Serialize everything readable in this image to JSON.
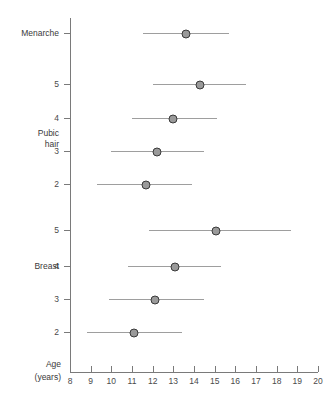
{
  "chart_data": {
    "type": "scatter",
    "title": "",
    "subtitle": "",
    "xlabel": "Age (years)",
    "ylabel": "",
    "xlim": [
      8,
      20
    ],
    "ylim": [
      0,
      10
    ],
    "grid": false,
    "legend": null,
    "orientation": "horizontal",
    "x_ticks": [
      8,
      9,
      10,
      11,
      12,
      13,
      14,
      15,
      16,
      17,
      18,
      19,
      20
    ],
    "x_tick_labels": [
      "8",
      "9",
      "10",
      "11",
      "12",
      "13",
      "14",
      "15",
      "16",
      "17",
      "18",
      "19",
      "20"
    ],
    "groups": [
      {
        "name": "Menarche",
        "label_lines": [
          "Menarche"
        ],
        "stages": [
          {
            "stage": "",
            "median": 13.6,
            "low": 11.55,
            "high": 15.7
          }
        ]
      },
      {
        "name": "Pubic hair",
        "label_lines": [
          "Pubic",
          "hair"
        ],
        "stages": [
          {
            "stage": "5",
            "median": 14.3,
            "low": 12.0,
            "high": 16.5
          },
          {
            "stage": "4",
            "median": 13.0,
            "low": 11.0,
            "high": 15.1
          },
          {
            "stage": "3",
            "median": 12.2,
            "low": 10.0,
            "high": 14.5
          },
          {
            "stage": "2",
            "median": 11.7,
            "low": 9.3,
            "high": 13.9
          }
        ]
      },
      {
        "name": "Breast",
        "label_lines": [
          "Breast"
        ],
        "stages": [
          {
            "stage": "5",
            "median": 15.05,
            "low": 11.8,
            "high": 18.7
          },
          {
            "stage": "4",
            "median": 13.1,
            "low": 10.8,
            "high": 15.3
          },
          {
            "stage": "3",
            "median": 12.1,
            "low": 9.9,
            "high": 14.5
          },
          {
            "stage": "2",
            "median": 11.1,
            "low": 8.8,
            "high": 13.4
          }
        ]
      }
    ],
    "rows": [
      {
        "id": "menarche",
        "group": "Menarche",
        "stage_label": "",
        "median": 13.6,
        "low": 11.55,
        "high": 15.7,
        "y": 33
      },
      {
        "id": "ph5",
        "group": "Pubic hair",
        "stage_label": "5",
        "median": 14.3,
        "low": 12.0,
        "high": 16.5,
        "y": 84
      },
      {
        "id": "ph4",
        "group": "Pubic hair",
        "stage_label": "4",
        "median": 13.0,
        "low": 11.0,
        "high": 15.1,
        "y": 118
      },
      {
        "id": "ph3",
        "group": "Pubic hair",
        "stage_label": "3",
        "median": 12.2,
        "low": 10.0,
        "high": 14.5,
        "y": 151
      },
      {
        "id": "ph2",
        "group": "Pubic hair",
        "stage_label": "2",
        "median": 11.7,
        "low": 9.3,
        "high": 13.9,
        "y": 184
      },
      {
        "id": "b5",
        "group": "Breast",
        "stage_label": "5",
        "median": 15.05,
        "low": 11.8,
        "high": 18.7,
        "y": 230
      },
      {
        "id": "b4",
        "group": "Breast",
        "stage_label": "4",
        "median": 13.1,
        "low": 10.8,
        "high": 15.3,
        "y": 266
      },
      {
        "id": "b3",
        "group": "Breast",
        "stage_label": "3",
        "median": 12.1,
        "low": 9.9,
        "high": 14.5,
        "y": 299
      },
      {
        "id": "b2",
        "group": "Breast",
        "stage_label": "2",
        "median": 11.1,
        "low": 8.8,
        "high": 13.4,
        "y": 332
      }
    ],
    "group_labels": [
      {
        "text_lines": [
          "Menarche"
        ],
        "y": 28
      },
      {
        "text_lines": [
          "Pubic",
          "hair"
        ],
        "y": 128
      },
      {
        "text_lines": [
          "Breast"
        ],
        "y": 261
      }
    ],
    "axis_corner_label_lines": [
      "Age",
      "(years)"
    ],
    "colors": {
      "marker_fill": "#9a9a9a",
      "marker_stroke": "#3a3a3a",
      "range_line": "#9e9e9e",
      "axis": "#7a7a7a",
      "text": "#3a3a3a",
      "background": "#ffffff"
    }
  }
}
